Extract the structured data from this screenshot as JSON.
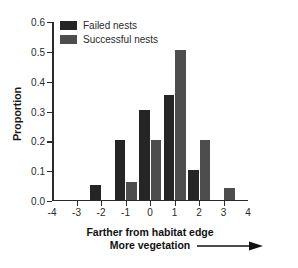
{
  "chart_data": {
    "type": "bar",
    "title": "",
    "xlabel": "Farther from habitat edge",
    "xlabel_line2": "More vegetation",
    "ylabel": "Proportion",
    "categories": [
      -4,
      -3,
      -2,
      -1,
      0,
      1,
      2,
      3,
      4
    ],
    "xlim": [
      -4,
      4
    ],
    "ylim": [
      0.0,
      0.6
    ],
    "xticks": [
      "-4",
      "-3",
      "-2",
      "-1",
      "0",
      "1",
      "2",
      "3",
      "4"
    ],
    "yticks": [
      "0.0",
      "0.1",
      "0.2",
      "0.3",
      "0.4",
      "0.5",
      "0.6"
    ],
    "grid": false,
    "legend_position": "top-left",
    "series": [
      {
        "name": "Failed nests",
        "color": "#252525",
        "x": [
          -2,
          -1,
          0,
          1,
          2
        ],
        "values": [
          0.05,
          0.2,
          0.3,
          0.35,
          0.1
        ]
      },
      {
        "name": "Successful nests",
        "color": "#4d4d4d",
        "x": [
          -1,
          0,
          1,
          2,
          3
        ],
        "values": [
          0.06,
          0.2,
          0.5,
          0.2,
          0.04
        ]
      }
    ]
  },
  "legend": {
    "items": [
      {
        "label": "Failed nests",
        "color": "#252525"
      },
      {
        "label": "Successful nests",
        "color": "#4d4d4d"
      }
    ]
  },
  "axes": {
    "y_label": "Proportion",
    "x_caption_line1": "Farther from habitat edge",
    "x_caption_line2": "More vegetation"
  },
  "colors": {
    "axis": "#2b2b2b",
    "failed": "#252525",
    "successful": "#4d4d4d",
    "background": "#ffffff"
  }
}
